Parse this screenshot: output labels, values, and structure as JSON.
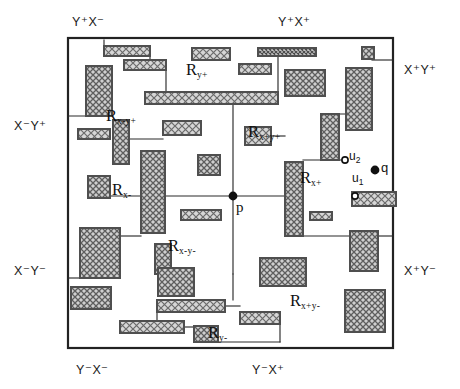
{
  "figure": {
    "colors": {
      "ink": "#222222",
      "outline": "#3a3a3a",
      "fill": "#b9b9b9",
      "background": "#ffffff",
      "line": "#2b2b2b"
    },
    "frame": {
      "x": 68,
      "y": 38,
      "width": 325,
      "height": 310
    }
  },
  "axis_labels": [
    {
      "name": "top-left",
      "text": "Y⁺X⁻",
      "x": 72,
      "y": 16
    },
    {
      "name": "top-right",
      "text": "Y⁺X⁺",
      "x": 278,
      "y": 16
    },
    {
      "name": "right-top",
      "text": "X⁺Y⁺",
      "x": 404,
      "y": 64
    },
    {
      "name": "left-top",
      "text": "X⁻Y⁺",
      "x": 14,
      "y": 120
    },
    {
      "name": "left-bottom",
      "text": "X⁻Y⁻",
      "x": 14,
      "y": 265
    },
    {
      "name": "right-bottom",
      "text": "X⁺Y⁻",
      "x": 404,
      "y": 265
    },
    {
      "name": "bottom-left",
      "text": "Y⁻X⁻",
      "x": 76,
      "y": 364
    },
    {
      "name": "bottom-right",
      "text": "Y⁻X⁺",
      "x": 252,
      "y": 364
    }
  ],
  "region_labels": [
    {
      "name": "R-y-plus",
      "base": "R",
      "sub": "y+",
      "x": 186,
      "y": 62
    },
    {
      "name": "R-x-minus-y-plus",
      "base": "R",
      "sub": "x-y+",
      "x": 106,
      "y": 108
    },
    {
      "name": "R-x-plus-y-plus",
      "base": "R",
      "sub": "x+y+",
      "x": 248,
      "y": 124
    },
    {
      "name": "R-x-minus",
      "base": "R",
      "sub": "x-",
      "x": 112,
      "y": 182
    },
    {
      "name": "R-x-plus",
      "base": "R",
      "sub": "x+",
      "x": 300,
      "y": 170
    },
    {
      "name": "R-x-minus-y-minus",
      "base": "R",
      "sub": "x-y-",
      "x": 168,
      "y": 238
    },
    {
      "name": "R-x-plus-y-minus",
      "base": "R",
      "sub": "x+y-",
      "x": 290,
      "y": 293
    },
    {
      "name": "R-y-minus",
      "base": "R",
      "sub": "y-",
      "x": 208,
      "y": 325
    }
  ],
  "points": [
    {
      "name": "p",
      "label": "p",
      "px": 233,
      "py": 196,
      "lx": 236,
      "ly": 200,
      "style": "filled"
    },
    {
      "name": "q",
      "label": "q",
      "px": 375,
      "py": 170,
      "lx": 381,
      "ly": 161,
      "style": "filled"
    },
    {
      "name": "u2",
      "label": "u",
      "sub": "2",
      "px": 345,
      "py": 160,
      "lx": 349,
      "ly": 150,
      "style": "open"
    },
    {
      "name": "u1",
      "label": "u",
      "sub": "1",
      "px": 355,
      "py": 196,
      "lx": 352,
      "ly": 172,
      "style": "open"
    }
  ],
  "rectangles": [
    {
      "name": "rect-01",
      "x": 104,
      "y": 46,
      "w": 46,
      "h": 10,
      "hatch": "coarse"
    },
    {
      "name": "rect-02",
      "x": 124,
      "y": 60,
      "w": 42,
      "h": 10,
      "hatch": "coarse"
    },
    {
      "name": "rect-03",
      "x": 86,
      "y": 66,
      "w": 26,
      "h": 50,
      "hatch": "cross"
    },
    {
      "name": "rect-04",
      "x": 192,
      "y": 48,
      "w": 38,
      "h": 12,
      "hatch": "coarse"
    },
    {
      "name": "rect-05",
      "x": 258,
      "y": 48,
      "w": 58,
      "h": 8,
      "hatch": "dense"
    },
    {
      "name": "rect-06",
      "x": 239,
      "y": 64,
      "w": 32,
      "h": 10,
      "hatch": "coarse"
    },
    {
      "name": "rect-07",
      "x": 145,
      "y": 92,
      "w": 133,
      "h": 12,
      "hatch": "coarse"
    },
    {
      "name": "rect-08",
      "x": 285,
      "y": 70,
      "w": 40,
      "h": 26,
      "hatch": "cross"
    },
    {
      "name": "rect-09",
      "x": 346,
      "y": 68,
      "w": 26,
      "h": 62,
      "hatch": "cross"
    },
    {
      "name": "rect-10",
      "x": 362,
      "y": 47,
      "w": 12,
      "h": 12,
      "hatch": "cross"
    },
    {
      "name": "rect-11",
      "x": 78,
      "y": 129,
      "w": 32,
      "h": 10,
      "hatch": "coarse"
    },
    {
      "name": "rect-12",
      "x": 113,
      "y": 120,
      "w": 16,
      "h": 44,
      "hatch": "cross"
    },
    {
      "name": "rect-13",
      "x": 163,
      "y": 121,
      "w": 38,
      "h": 14,
      "hatch": "coarse"
    },
    {
      "name": "rect-14",
      "x": 245,
      "y": 127,
      "w": 26,
      "h": 18,
      "hatch": "coarse"
    },
    {
      "name": "rect-15",
      "x": 141,
      "y": 151,
      "w": 24,
      "h": 82,
      "hatch": "cross"
    },
    {
      "name": "rect-16",
      "x": 198,
      "y": 155,
      "w": 22,
      "h": 20,
      "hatch": "cross"
    },
    {
      "name": "rect-17",
      "x": 321,
      "y": 114,
      "w": 18,
      "h": 46,
      "hatch": "cross"
    },
    {
      "name": "rect-18",
      "x": 285,
      "y": 162,
      "w": 18,
      "h": 74,
      "hatch": "cross"
    },
    {
      "name": "rect-19",
      "x": 88,
      "y": 176,
      "w": 22,
      "h": 22,
      "hatch": "cross"
    },
    {
      "name": "rect-20",
      "x": 181,
      "y": 210,
      "w": 40,
      "h": 10,
      "hatch": "coarse"
    },
    {
      "name": "rect-21",
      "x": 80,
      "y": 228,
      "w": 40,
      "h": 50,
      "hatch": "cross"
    },
    {
      "name": "rect-22",
      "x": 155,
      "y": 244,
      "w": 16,
      "h": 30,
      "hatch": "cross"
    },
    {
      "name": "rect-23",
      "x": 352,
      "y": 192,
      "w": 44,
      "h": 14,
      "hatch": "coarse"
    },
    {
      "name": "rect-24",
      "x": 310,
      "y": 212,
      "w": 22,
      "h": 8,
      "hatch": "coarse"
    },
    {
      "name": "rect-25",
      "x": 350,
      "y": 231,
      "w": 28,
      "h": 40,
      "hatch": "cross"
    },
    {
      "name": "rect-26",
      "x": 71,
      "y": 287,
      "w": 40,
      "h": 22,
      "hatch": "cross"
    },
    {
      "name": "rect-27",
      "x": 158,
      "y": 268,
      "w": 36,
      "h": 28,
      "hatch": "cross"
    },
    {
      "name": "rect-28",
      "x": 260,
      "y": 258,
      "w": 46,
      "h": 28,
      "hatch": "cross"
    },
    {
      "name": "rect-29",
      "x": 157,
      "y": 300,
      "w": 68,
      "h": 12,
      "hatch": "coarse"
    },
    {
      "name": "rect-30",
      "x": 120,
      "y": 321,
      "w": 64,
      "h": 12,
      "hatch": "coarse"
    },
    {
      "name": "rect-31",
      "x": 194,
      "y": 326,
      "w": 24,
      "h": 16,
      "hatch": "cross"
    },
    {
      "name": "rect-32",
      "x": 240,
      "y": 312,
      "w": 40,
      "h": 12,
      "hatch": "coarse"
    },
    {
      "name": "rect-33",
      "x": 345,
      "y": 290,
      "w": 40,
      "h": 42,
      "hatch": "cross"
    }
  ],
  "segments": [
    {
      "name": "seg-p-up",
      "x1": 233,
      "y1": 196,
      "x2": 233,
      "y2": 104
    },
    {
      "name": "seg-p-down",
      "x1": 233,
      "y1": 196,
      "x2": 233,
      "y2": 274
    },
    {
      "name": "seg-p-left",
      "x1": 233,
      "y1": 196,
      "x2": 110,
      "y2": 196
    },
    {
      "name": "seg-p-right",
      "x1": 233,
      "y1": 196,
      "x2": 285,
      "y2": 196
    },
    {
      "name": "seg-tl-1",
      "x1": 68,
      "y1": 116,
      "x2": 113,
      "y2": 116
    },
    {
      "name": "seg-tl-2",
      "x1": 129,
      "y1": 139,
      "x2": 163,
      "y2": 139
    },
    {
      "name": "seg-tl-3",
      "x1": 104,
      "y1": 40,
      "x2": 104,
      "y2": 46
    },
    {
      "name": "seg-tl-4",
      "x1": 150,
      "y1": 51,
      "x2": 150,
      "y2": 60
    },
    {
      "name": "seg-tl-5",
      "x1": 166,
      "y1": 65,
      "x2": 166,
      "y2": 92
    },
    {
      "name": "seg-tl-6",
      "x1": 258,
      "y1": 52,
      "x2": 278,
      "y2": 52
    },
    {
      "name": "seg-tl-7",
      "x1": 278,
      "y1": 52,
      "x2": 278,
      "y2": 92
    },
    {
      "name": "seg-tr-1",
      "x1": 339,
      "y1": 114,
      "x2": 372,
      "y2": 114
    },
    {
      "name": "seg-tr-2",
      "x1": 303,
      "y1": 160,
      "x2": 345,
      "y2": 160
    },
    {
      "name": "seg-tr-3",
      "x1": 372,
      "y1": 60,
      "x2": 393,
      "y2": 60
    },
    {
      "name": "seg-bl-1",
      "x1": 110,
      "y1": 196,
      "x2": 110,
      "y2": 176
    },
    {
      "name": "seg-bl-2",
      "x1": 120,
      "y1": 236,
      "x2": 141,
      "y2": 236
    },
    {
      "name": "seg-bl-3",
      "x1": 68,
      "y1": 278,
      "x2": 80,
      "y2": 278
    },
    {
      "name": "seg-bl-4",
      "x1": 233,
      "y1": 274,
      "x2": 233,
      "y2": 300
    },
    {
      "name": "seg-br-1",
      "x1": 285,
      "y1": 236,
      "x2": 352,
      "y2": 236
    },
    {
      "name": "seg-br-2",
      "x1": 378,
      "y1": 236,
      "x2": 393,
      "y2": 236
    },
    {
      "name": "seg-br-3",
      "x1": 225,
      "y1": 306,
      "x2": 240,
      "y2": 306
    },
    {
      "name": "seg-br-4",
      "x1": 280,
      "y1": 318,
      "x2": 280,
      "y2": 342
    },
    {
      "name": "seg-bl-5",
      "x1": 157,
      "y1": 312,
      "x2": 157,
      "y2": 321
    },
    {
      "name": "seg-bl-6",
      "x1": 184,
      "y1": 327,
      "x2": 194,
      "y2": 327
    },
    {
      "name": "seg-bl-7",
      "x1": 218,
      "y1": 342,
      "x2": 280,
      "y2": 342
    },
    {
      "name": "seg-tr-4",
      "x1": 271,
      "y1": 136,
      "x2": 285,
      "y2": 136
    }
  ]
}
